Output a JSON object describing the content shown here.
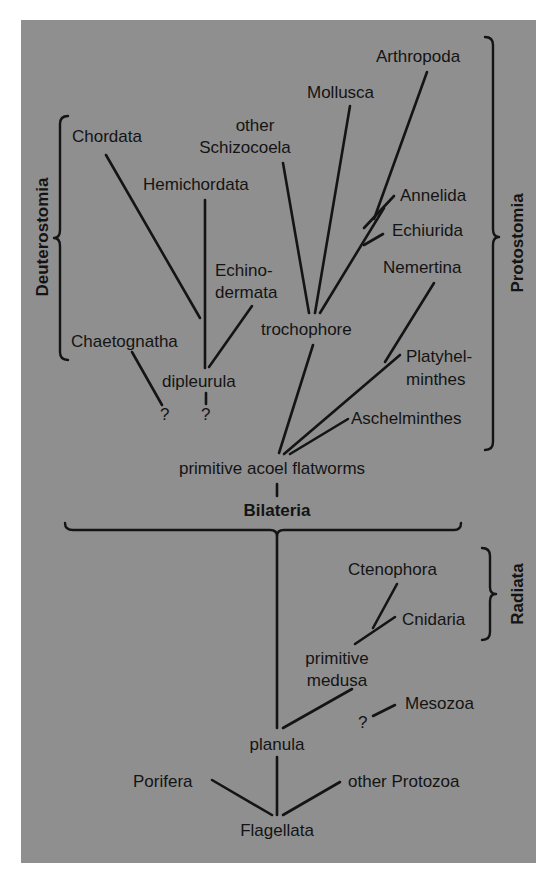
{
  "diagram": {
    "background_color": "#8f8f8f",
    "line_color": "#141414",
    "groups": {
      "deuterostomia": "Deuterostomia",
      "protostomia": "Protostomia",
      "bilateria": "Bilateria",
      "radiata": "Radiata"
    },
    "taxa": {
      "chordata": "Chordata",
      "hemichordata": "Hemichordata",
      "echinodermata_1": "Echino-",
      "echinodermata_2": "dermata",
      "chaetognatha": "Chaetognatha",
      "dipleurula": "dipleurula",
      "unknown_1": "?",
      "unknown_2": "?",
      "other_schizocoela_1": "other",
      "other_schizocoela_2": "Schizocoela",
      "mollusca": "Mollusca",
      "arthropoda": "Arthropoda",
      "annelida": "Annelida",
      "echiurida": "Echiurida",
      "nemertina": "Nemertina",
      "trochophore": "trochophore",
      "platyhelminthes_1": "Platyhel-",
      "platyhelminthes_2": "minthes",
      "aschelminthes": "Aschelminthes",
      "primitive_acoel_flatworms": "primitive acoel flatworms",
      "ctenophora": "Ctenophora",
      "cnidaria": "Cnidaria",
      "primitive_medusa_1": "primitive",
      "primitive_medusa_2": "medusa",
      "mesozoa": "Mesozoa",
      "unknown_3": "?",
      "planula": "planula",
      "porifera": "Porifera",
      "other_protozoa": "other Protozoa",
      "flagellata": "Flagellata"
    }
  }
}
